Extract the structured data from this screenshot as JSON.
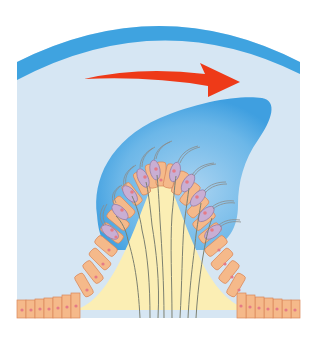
{
  "figure": {
    "colors": {
      "background": "#ffffff",
      "endolymph": "#d6e6f3",
      "canal_wall": "#3fa3e0",
      "cupula": "#4aa6e3",
      "cupula_light": "#a9d3f1",
      "arrow": "#ee3a18",
      "supporting_cell": "#f5b98a",
      "supporting_cell_outline": "#d9875a",
      "hair_cell": "#c9aed3",
      "hair_cell_outline": "#8f79a8",
      "nucleus": "#e57a86",
      "connective_tissue": "#fbeeb4",
      "nerve_fiber": "#7c8070",
      "stereocilia": "#8a8c8a"
    },
    "elements": [
      {
        "name": "canal-wall",
        "label": "Membranous canal wall"
      },
      {
        "name": "flow-arrow",
        "label": "Endolymph flow direction (left to right)"
      },
      {
        "name": "cupula",
        "label": "Cupula (deflected)"
      },
      {
        "name": "hair-cells",
        "label": "Hair cells with stereocilia"
      },
      {
        "name": "supporting-cells",
        "label": "Supporting epithelial cells"
      },
      {
        "name": "nerve-fibers",
        "label": "Nerve fibers"
      },
      {
        "name": "crista-core",
        "label": "Connective tissue core"
      }
    ]
  }
}
